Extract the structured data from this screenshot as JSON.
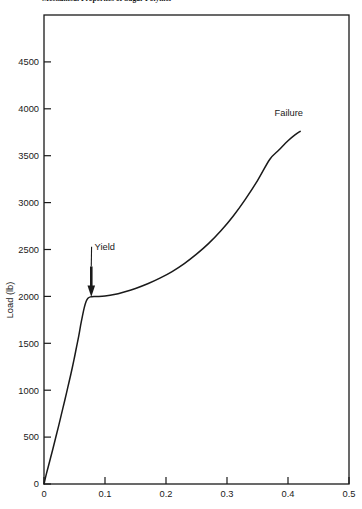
{
  "chart_data": {
    "type": "line",
    "title": "Mechanical Properties of Sugar Polymer",
    "xlabel": "",
    "ylabel": "Load (lb)",
    "xlim": [
      0,
      0.5
    ],
    "ylim": [
      0,
      5000
    ],
    "xticks": [
      "0",
      "0.1",
      "0.2",
      "0.3",
      "0.4",
      "0.5"
    ],
    "xtick_values": [
      0,
      0.1,
      0.2,
      0.3,
      0.4,
      0.5
    ],
    "yticks": [
      "0",
      "500",
      "1000",
      "1500",
      "2000",
      "2500",
      "3000",
      "3500",
      "4000",
      "4500"
    ],
    "ytick_values": [
      0,
      500,
      1000,
      1500,
      2000,
      2500,
      3000,
      3500,
      4000,
      4500
    ],
    "grid": false,
    "legend": "none",
    "series": [
      {
        "name": "load-extension",
        "color": "#1a1a1a",
        "x": [
          0.0,
          0.004,
          0.009,
          0.014,
          0.019,
          0.024,
          0.029,
          0.034,
          0.039,
          0.044,
          0.049,
          0.053,
          0.057,
          0.06,
          0.063,
          0.066,
          0.069,
          0.072,
          0.076,
          0.082,
          0.09,
          0.1,
          0.115,
          0.13,
          0.15,
          0.17,
          0.19,
          0.21,
          0.23,
          0.25,
          0.27,
          0.29,
          0.31,
          0.33,
          0.35,
          0.37,
          0.385,
          0.4,
          0.412,
          0.42
        ],
        "y": [
          0,
          110,
          235,
          360,
          490,
          620,
          755,
          890,
          1030,
          1170,
          1320,
          1450,
          1580,
          1690,
          1790,
          1880,
          1945,
          1980,
          1995,
          2000,
          2000,
          2005,
          2020,
          2045,
          2085,
          2135,
          2195,
          2265,
          2350,
          2450,
          2565,
          2700,
          2855,
          3035,
          3235,
          3460,
          3560,
          3660,
          3725,
          3760
        ]
      }
    ],
    "annotations": [
      {
        "text": "Yield",
        "kind": "arrow-label",
        "label_x": 0.078,
        "label_y": 2530,
        "point_x": 0.0775,
        "point_y": 2010
      },
      {
        "text": "Failure",
        "kind": "text-label",
        "label_x": 0.378,
        "label_y": 3925
      }
    ]
  }
}
